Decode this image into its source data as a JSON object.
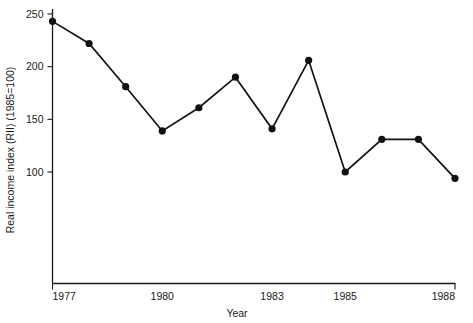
{
  "chart_data": {
    "type": "line",
    "title": "",
    "xlabel": "Year",
    "ylabel": "Real income index (RII) (1985=100)",
    "x": [
      1977,
      1978,
      1979,
      1980,
      1981,
      1982,
      1983,
      1984,
      1985,
      1986,
      1987,
      1988
    ],
    "values": [
      243,
      222,
      181,
      139,
      161,
      190,
      141,
      206,
      100,
      131,
      131,
      94
    ],
    "series": [
      {
        "name": "Real income index (RII)",
        "values": [
          243,
          222,
          181,
          139,
          161,
          190,
          141,
          206,
          100,
          131,
          131,
          94
        ]
      }
    ],
    "xlim": [
      1977,
      1988
    ],
    "ylim": [
      75,
      255
    ],
    "xticks": [
      1977,
      1980,
      1983,
      1985,
      1988
    ],
    "xtick_labels": [
      "1977",
      "1980",
      "1983",
      "1985",
      "1988"
    ],
    "yticks": [
      100,
      150,
      200,
      250
    ],
    "ytick_labels": [
      "100",
      "150",
      "200",
      "250"
    ],
    "grid": false,
    "legend": false,
    "marker": "filled-circle",
    "line_color": "#111111",
    "marker_color": "#111111",
    "axis_color": "#1a1a1a",
    "background": "#ffffff"
  }
}
